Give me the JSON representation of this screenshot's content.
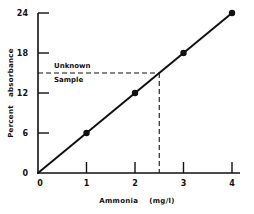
{
  "chart_data": {
    "type": "line",
    "title": "",
    "xlabel": "Ammonia (mg/l)",
    "ylabel": "Percent absorbance",
    "x": [
      1,
      2,
      3,
      4
    ],
    "series": [
      {
        "name": "Calibration",
        "values": [
          6,
          12,
          18,
          24
        ]
      }
    ],
    "line_from_origin": true,
    "xlim": [
      0,
      4
    ],
    "ylim": [
      0,
      24
    ],
    "x_ticks": [
      "0",
      "1",
      "2",
      "3",
      "4"
    ],
    "y_ticks": [
      "0",
      "6",
      "12",
      "18",
      "24"
    ],
    "grid": false,
    "legend": "none",
    "annotations": [
      {
        "text": "Unknown Sample",
        "x": 2.5,
        "y": 15,
        "style": "dashed guide lines to both axes"
      }
    ]
  },
  "labels": {
    "xlabel": "Ammonia    (mg/l)",
    "ylabel": "Percent   absorbance",
    "annot_line1": "Unknown",
    "annot_line2": "Sample",
    "origin_y": "0",
    "origin_x": "0"
  }
}
